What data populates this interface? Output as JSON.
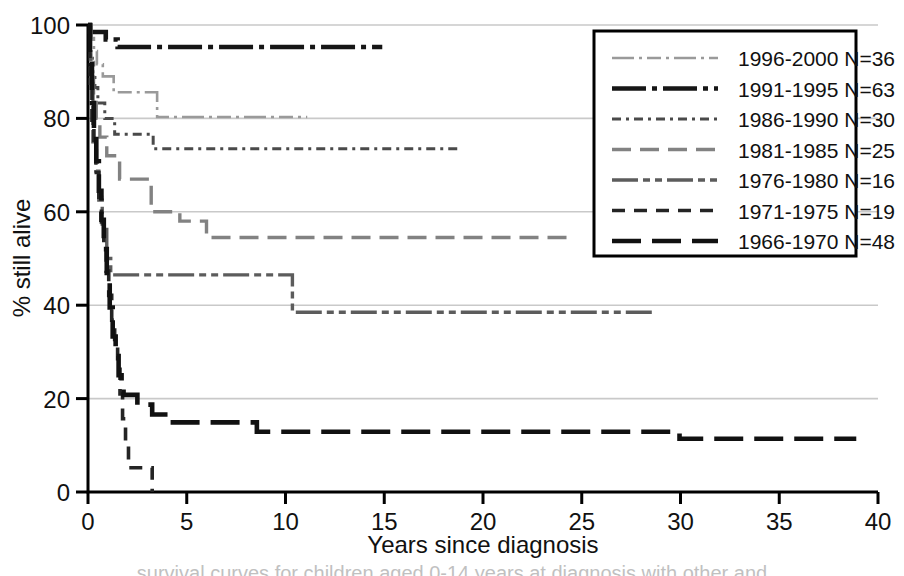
{
  "figure": {
    "title": "",
    "caption_partial": "survival curves for children aged 0-14 years at diagnosis with other and"
  },
  "chart_data": {
    "type": "line",
    "title": "",
    "subtitle": "",
    "xlabel": "Years since diagnosis",
    "ylabel": "% still alive",
    "xlim": [
      0,
      40
    ],
    "ylim": [
      0,
      100
    ],
    "xticks": [
      0,
      5,
      10,
      15,
      20,
      25,
      30,
      35,
      40
    ],
    "yticks": [
      0,
      20,
      40,
      60,
      80,
      100
    ],
    "xtick_labels": [
      "0",
      "5",
      "10",
      "15",
      "20",
      "25",
      "30",
      "35",
      "40"
    ],
    "ytick_labels": [
      "0",
      "20",
      "40",
      "60",
      "80",
      "100"
    ],
    "grid": "horizontal",
    "legend_position": "top-right",
    "step_type": "post",
    "series": [
      {
        "name": "1996-2000 N=36",
        "label": "1996-2000 N=36",
        "n": 36,
        "period": "1996-2000",
        "color": "#9a9a9a",
        "width": 2.6,
        "dash": "22,5,3,5,14,5,3,5",
        "points": [
          [
            0,
            100
          ],
          [
            0.18,
            97.2
          ],
          [
            0.3,
            94.4
          ],
          [
            0.45,
            91.6
          ],
          [
            0.75,
            89.0
          ],
          [
            1.25,
            89.0
          ],
          [
            1.3,
            85.6
          ],
          [
            3.45,
            85.6
          ],
          [
            3.5,
            80.3
          ],
          [
            11.1,
            80.3
          ]
        ]
      },
      {
        "name": "1991-1995 N=63",
        "label": "1991-1995 N=63",
        "n": 63,
        "period": "1991-1995",
        "color": "#161616",
        "width": 4.6,
        "dash": "34,6,5,6",
        "points": [
          [
            0,
            100
          ],
          [
            0.1,
            98.5
          ],
          [
            0.85,
            98.5
          ],
          [
            0.9,
            96.9
          ],
          [
            1.45,
            96.9
          ],
          [
            1.5,
            95.3
          ],
          [
            14.9,
            95.3
          ]
        ]
      },
      {
        "name": "1986-1990 N=30",
        "label": "1986-1990 N=30",
        "n": 30,
        "period": "1986-1990",
        "color": "#4a4a4a",
        "width": 3.0,
        "dash": "9,5,3,5",
        "points": [
          [
            0,
            100
          ],
          [
            0.12,
            93.3
          ],
          [
            0.22,
            90.0
          ],
          [
            0.35,
            86.6
          ],
          [
            0.5,
            83.3
          ],
          [
            0.85,
            80.0
          ],
          [
            1.3,
            80.0
          ],
          [
            1.35,
            76.6
          ],
          [
            3.25,
            76.6
          ],
          [
            3.3,
            73.5
          ],
          [
            18.9,
            73.5
          ]
        ]
      },
      {
        "name": "1981-1985 N=25",
        "label": "1981-1985 N=25",
        "n": 25,
        "period": "1981-1985",
        "color": "#828282",
        "width": 3.4,
        "dash": "19,9",
        "points": [
          [
            0,
            100
          ],
          [
            0.15,
            92.0
          ],
          [
            0.28,
            84.0
          ],
          [
            0.42,
            80.0
          ],
          [
            0.6,
            76.0
          ],
          [
            0.95,
            72.0
          ],
          [
            1.55,
            72.0
          ],
          [
            1.6,
            67.0
          ],
          [
            3.15,
            67.0
          ],
          [
            3.2,
            60.0
          ],
          [
            4.6,
            60.0
          ],
          [
            4.65,
            58.0
          ],
          [
            5.95,
            58.0
          ],
          [
            6.0,
            54.5
          ],
          [
            24.4,
            54.5
          ]
        ]
      },
      {
        "name": "1976-1980 N=16",
        "label": "1976-1980 N=16",
        "n": 16,
        "period": "1976-1980",
        "color": "#5c5c5c",
        "width": 3.4,
        "dash": "26,5,7,5,7,5",
        "points": [
          [
            0,
            100
          ],
          [
            0.12,
            87.5
          ],
          [
            0.25,
            75.0
          ],
          [
            0.4,
            68.7
          ],
          [
            0.55,
            62.5
          ],
          [
            0.72,
            56.2
          ],
          [
            0.95,
            50.0
          ],
          [
            1.15,
            46.5
          ],
          [
            10.3,
            46.5
          ],
          [
            10.35,
            38.5
          ],
          [
            28.7,
            38.5
          ]
        ]
      },
      {
        "name": "1971-1975 N=19",
        "label": "1971-1975 N=19",
        "n": 19,
        "period": "1971-1975",
        "color": "#242424",
        "width": 3.6,
        "dash": "13,9",
        "points": [
          [
            0,
            100
          ],
          [
            0.1,
            89.4
          ],
          [
            0.2,
            78.9
          ],
          [
            0.3,
            73.6
          ],
          [
            0.42,
            68.4
          ],
          [
            0.55,
            63.1
          ],
          [
            0.68,
            57.8
          ],
          [
            0.8,
            52.6
          ],
          [
            0.92,
            47.3
          ],
          [
            1.05,
            42.1
          ],
          [
            1.2,
            36.8
          ],
          [
            1.35,
            31.5
          ],
          [
            1.5,
            26.3
          ],
          [
            1.62,
            21.0
          ],
          [
            1.75,
            15.7
          ],
          [
            1.9,
            10.5
          ],
          [
            2.05,
            5.2
          ],
          [
            3.2,
            5.2
          ],
          [
            3.25,
            0
          ]
        ]
      },
      {
        "name": "1966-1970 N=48",
        "label": "1966-1970 N=48",
        "n": 48,
        "period": "1966-1970",
        "color": "#111111",
        "width": 4.6,
        "dash": "29,11",
        "points": [
          [
            0,
            100
          ],
          [
            0.1,
            91.6
          ],
          [
            0.2,
            83.3
          ],
          [
            0.3,
            77.0
          ],
          [
            0.42,
            70.8
          ],
          [
            0.55,
            64.5
          ],
          [
            0.68,
            58.3
          ],
          [
            0.8,
            52.0
          ],
          [
            0.95,
            45.8
          ],
          [
            1.1,
            39.5
          ],
          [
            1.25,
            33.3
          ],
          [
            1.4,
            29.1
          ],
          [
            1.55,
            25.0
          ],
          [
            1.7,
            22.9
          ],
          [
            1.8,
            20.8
          ],
          [
            2.45,
            20.8
          ],
          [
            2.5,
            18.7
          ],
          [
            3.2,
            18.7
          ],
          [
            3.25,
            16.6
          ],
          [
            4.0,
            16.6
          ],
          [
            4.05,
            14.9
          ],
          [
            8.5,
            14.9
          ],
          [
            8.55,
            12.9
          ],
          [
            29.9,
            12.9
          ],
          [
            29.95,
            11.4
          ],
          [
            38.9,
            11.4
          ]
        ]
      }
    ]
  },
  "legend": {
    "entries": [
      {
        "label": "1996-2000 N=36"
      },
      {
        "label": "1991-1995 N=63"
      },
      {
        "label": "1986-1990 N=30"
      },
      {
        "label": "1981-1985 N=25"
      },
      {
        "label": "1976-1980 N=16"
      },
      {
        "label": "1971-1975 N=19"
      },
      {
        "label": "1966-1970 N=48"
      }
    ]
  }
}
